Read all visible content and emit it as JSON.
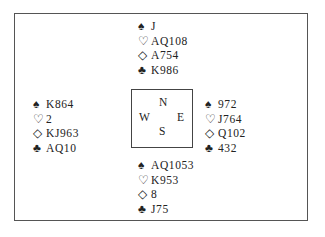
{
  "suits": {
    "spades": "♠",
    "hearts": "♡",
    "diamonds": "◇",
    "clubs": "♣"
  },
  "compass": {
    "north": "N",
    "west": "W",
    "east": "E",
    "south": "S"
  },
  "hands": {
    "north": {
      "spades": "J",
      "hearts": "AQ108",
      "diamonds": "A754",
      "clubs": "K986"
    },
    "west": {
      "spades": "K864",
      "hearts": "2",
      "diamonds": "KJ963",
      "clubs": "AQ10"
    },
    "east": {
      "spades": "972",
      "hearts": "J764",
      "diamonds": "Q102",
      "clubs": "432"
    },
    "south": {
      "spades": "AQ1053",
      "hearts": "K953",
      "diamonds": "8",
      "clubs": "J75"
    }
  }
}
